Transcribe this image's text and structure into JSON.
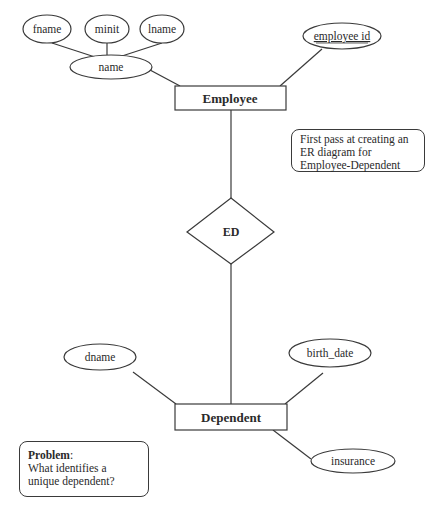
{
  "diagram": {
    "type": "ER diagram",
    "colors": {
      "stroke": "#3a3a3a",
      "text": "#2a2a2a",
      "background": "#ffffff"
    },
    "entities": {
      "employee": "Employee",
      "dependent": "Dependent"
    },
    "relationship": {
      "label": "ED"
    },
    "attributes": {
      "fname": "fname",
      "minit": "minit",
      "lname": "lname",
      "name": "name",
      "employee_id": "employee id",
      "dname": "dname",
      "birth_date": "birth_date",
      "insurance": "insurance"
    },
    "notes": {
      "first_pass": "First pass at creating an ER diagram for Employee-Dependent",
      "problem_title": "Problem",
      "problem_colon": ":",
      "problem_text": "What identifies a unique dependent?"
    }
  }
}
